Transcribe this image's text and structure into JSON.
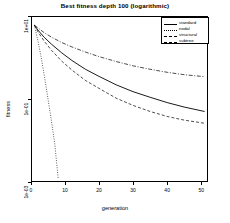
{
  "chart_data": {
    "type": "line",
    "title": "Best fitness depth 100 (logarithmic)",
    "xlabel": "generation",
    "ylabel": "fitness",
    "xlim": [
      0,
      52
    ],
    "ylim_log": [
      0.001,
      10.0
    ],
    "yscale": "log",
    "grid": false,
    "legend_position": "top-right",
    "xticks": [
      "0",
      "10",
      "20",
      "30",
      "40",
      "50"
    ],
    "xtick_values": [
      0,
      10,
      20,
      30,
      40,
      50
    ],
    "yticks": [
      "1e+01",
      "1e-01",
      "1e-03"
    ],
    "ytick_values": [
      10,
      0.1,
      0.001
    ],
    "series": [
      {
        "name": "standard",
        "style": "solid",
        "x": [
          1,
          2,
          4,
          6,
          9,
          12,
          16,
          20,
          25,
          30,
          35,
          40,
          45,
          51
        ],
        "y": [
          6.0,
          4.6,
          3.0,
          2.1,
          1.3,
          0.85,
          0.52,
          0.35,
          0.22,
          0.15,
          0.11,
          0.082,
          0.064,
          0.05
        ]
      },
      {
        "name": "nodal",
        "style": "dotted",
        "x": [
          1,
          2,
          3,
          4,
          5,
          6,
          7,
          8
        ],
        "y": [
          6.0,
          2.6,
          1.0,
          0.33,
          0.1,
          0.03,
          0.008,
          0.0012
        ]
      },
      {
        "name": "structural",
        "style": "dashed",
        "x": [
          1,
          2,
          4,
          6,
          9,
          12,
          16,
          20,
          25,
          30,
          35,
          40,
          45,
          51
        ],
        "y": [
          6.0,
          4.2,
          2.4,
          1.5,
          0.82,
          0.5,
          0.28,
          0.18,
          0.105,
          0.07,
          0.05,
          0.038,
          0.031,
          0.026
        ]
      },
      {
        "name": "subtree",
        "style": "dashdot",
        "x": [
          1,
          2,
          4,
          6,
          9,
          12,
          16,
          20,
          25,
          30,
          35,
          40,
          45,
          51
        ],
        "y": [
          6.0,
          5.2,
          3.9,
          3.1,
          2.3,
          1.8,
          1.35,
          1.05,
          0.8,
          0.63,
          0.52,
          0.44,
          0.385,
          0.345
        ]
      }
    ]
  },
  "legend": {
    "items": [
      {
        "label": "standard"
      },
      {
        "label": "nodal"
      },
      {
        "label": "structural"
      },
      {
        "label": "subtree"
      }
    ]
  }
}
